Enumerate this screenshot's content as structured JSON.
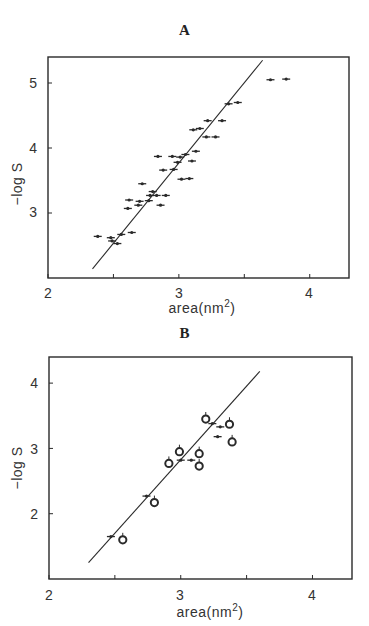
{
  "chart_data": [
    {
      "panel": "A",
      "type": "scatter",
      "title": "A",
      "xlabel": "area(nm²)",
      "ylabel": "−log S",
      "xlim": [
        2.0,
        4.3
      ],
      "ylim": [
        2.0,
        5.4
      ],
      "xticks": [
        2,
        2.5,
        3,
        3.5,
        4
      ],
      "xtick_labels": [
        "2",
        "",
        "3",
        "",
        "4"
      ],
      "yticks": [
        3,
        4,
        5
      ],
      "ytick_labels": [
        "3",
        "4",
        "5"
      ],
      "grid": false,
      "legend": null,
      "fit_line": {
        "x": [
          2.34,
          3.64
        ],
        "y": [
          2.14,
          5.35
        ]
      },
      "series": [
        {
          "name": "compounds",
          "points": [
            {
              "x": 2.38,
              "y": 2.64
            },
            {
              "x": 2.48,
              "y": 2.62
            },
            {
              "x": 2.49,
              "y": 2.57
            },
            {
              "x": 2.53,
              "y": 2.53
            },
            {
              "x": 2.56,
              "y": 2.67
            },
            {
              "x": 2.64,
              "y": 2.7
            },
            {
              "x": 2.61,
              "y": 3.07
            },
            {
              "x": 2.62,
              "y": 3.2
            },
            {
              "x": 2.7,
              "y": 3.18
            },
            {
              "x": 2.69,
              "y": 3.12
            },
            {
              "x": 2.72,
              "y": 3.45
            },
            {
              "x": 2.77,
              "y": 3.19
            },
            {
              "x": 2.78,
              "y": 3.27
            },
            {
              "x": 2.8,
              "y": 3.33
            },
            {
              "x": 2.83,
              "y": 3.27
            },
            {
              "x": 2.86,
              "y": 3.12
            },
            {
              "x": 2.9,
              "y": 3.27
            },
            {
              "x": 2.88,
              "y": 3.66
            },
            {
              "x": 2.84,
              "y": 3.87
            },
            {
              "x": 2.95,
              "y": 3.87
            },
            {
              "x": 2.96,
              "y": 3.67
            },
            {
              "x": 2.99,
              "y": 3.78
            },
            {
              "x": 3.01,
              "y": 3.86
            },
            {
              "x": 3.02,
              "y": 3.52
            },
            {
              "x": 3.08,
              "y": 3.53
            },
            {
              "x": 3.05,
              "y": 3.9
            },
            {
              "x": 3.1,
              "y": 3.8
            },
            {
              "x": 3.13,
              "y": 3.95
            },
            {
              "x": 3.11,
              "y": 4.28
            },
            {
              "x": 3.16,
              "y": 4.3
            },
            {
              "x": 3.21,
              "y": 4.17
            },
            {
              "x": 3.28,
              "y": 4.17
            },
            {
              "x": 3.22,
              "y": 4.42
            },
            {
              "x": 3.33,
              "y": 4.42
            },
            {
              "x": 3.38,
              "y": 4.68
            },
            {
              "x": 3.45,
              "y": 4.7
            },
            {
              "x": 3.7,
              "y": 5.05
            },
            {
              "x": 3.82,
              "y": 5.06
            }
          ]
        }
      ]
    },
    {
      "panel": "B",
      "type": "scatter",
      "title": "B",
      "xlabel": "area(nm²)",
      "ylabel": "−log S",
      "xlim": [
        2.0,
        4.3
      ],
      "ylim": [
        1.0,
        4.4
      ],
      "xticks": [
        2,
        2.5,
        3,
        3.5,
        4
      ],
      "xtick_labels": [
        "2",
        "",
        "3",
        "",
        "4"
      ],
      "yticks": [
        2,
        3,
        4
      ],
      "ytick_labels": [
        "2",
        "3",
        "4"
      ],
      "grid": false,
      "legend": null,
      "fit_line": {
        "x": [
          2.3,
          3.6
        ],
        "y": [
          1.25,
          4.18
        ]
      },
      "series": [
        {
          "name": "ring compounds (circles)",
          "points": [
            {
              "x": 2.56,
              "y": 1.6
            },
            {
              "x": 2.8,
              "y": 2.17
            },
            {
              "x": 2.91,
              "y": 2.77
            },
            {
              "x": 2.99,
              "y": 2.95
            },
            {
              "x": 3.14,
              "y": 2.92
            },
            {
              "x": 3.14,
              "y": 2.73
            },
            {
              "x": 3.19,
              "y": 3.45
            },
            {
              "x": 3.37,
              "y": 3.37
            },
            {
              "x": 3.39,
              "y": 3.1
            }
          ]
        },
        {
          "name": "chain compounds (small markers)",
          "points": [
            {
              "x": 2.47,
              "y": 1.65
            },
            {
              "x": 2.74,
              "y": 2.27
            },
            {
              "x": 3.0,
              "y": 2.82
            },
            {
              "x": 3.08,
              "y": 2.82
            },
            {
              "x": 3.24,
              "y": 3.38
            },
            {
              "x": 3.3,
              "y": 3.33
            },
            {
              "x": 3.28,
              "y": 3.18
            }
          ]
        }
      ]
    }
  ],
  "panels": {
    "A": {
      "title": "A",
      "xlabel": "area(nm",
      "xlabel_sup": "2",
      "xlabel_end": ")",
      "ylabel": "−log S",
      "xticks": [
        "2",
        "3",
        "4"
      ],
      "yticks": [
        "3",
        "4",
        "5"
      ]
    },
    "B": {
      "title": "B",
      "xlabel": "area(nm",
      "xlabel_sup": "2",
      "xlabel_end": ")",
      "ylabel": "−log S",
      "xticks": [
        "2",
        "3",
        "4"
      ],
      "yticks": [
        "2",
        "3",
        "4"
      ]
    }
  },
  "colors": {
    "ink": "#2a2a2a",
    "background": "#ffffff"
  }
}
